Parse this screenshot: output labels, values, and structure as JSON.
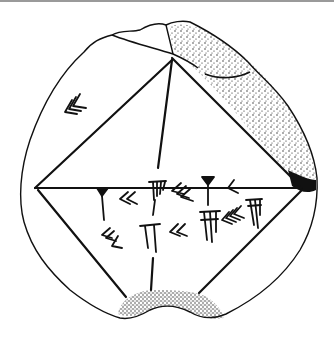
{
  "figure": {
    "colors": {
      "ink": "#111111",
      "paper": "#ffffff",
      "frame_bar": "#9a9a9a",
      "stipple": "#1a1a1a"
    },
    "rhombus": {
      "top": [
        172,
        60
      ],
      "left": [
        35,
        188
      ],
      "right": [
        302,
        188
      ],
      "bottom_left_end": [
        126,
        297
      ],
      "bottom_right_end": [
        199,
        293
      ]
    },
    "vertical_line": {
      "top": [
        172,
        60
      ],
      "bottom": [
        158,
        168
      ],
      "lower_top": [
        153,
        258
      ],
      "lower_bottom": [
        151,
        290
      ]
    },
    "cuneiform_groups": [
      {
        "name": "upper-left-tens",
        "x": 66,
        "y": 98,
        "winkel_hooks": 3
      },
      {
        "name": "row1-one",
        "x": 102,
        "y": 188,
        "wedges": 1
      },
      {
        "name": "row1-twenty",
        "x": 125,
        "y": 196,
        "winkel_hooks": 2
      },
      {
        "name": "row1-four",
        "x": 155,
        "y": 183,
        "wedges": 4
      },
      {
        "name": "row1-thirty",
        "x": 175,
        "y": 190,
        "winkel_hooks": 3
      },
      {
        "name": "row1-one-b",
        "x": 207,
        "y": 181,
        "wedges": 1
      },
      {
        "name": "row1-ten",
        "x": 231,
        "y": 188,
        "winkel_hooks": 1
      },
      {
        "name": "row2-thirty",
        "x": 100,
        "y": 232,
        "winkel_hooks": 3
      },
      {
        "name": "row2-two",
        "x": 145,
        "y": 228,
        "wedges": 2
      },
      {
        "name": "row2-twenty",
        "x": 176,
        "y": 228,
        "winkel_hooks": 2
      },
      {
        "name": "row2-six",
        "x": 206,
        "y": 215,
        "wedges": 6
      },
      {
        "name": "row2-forty",
        "x": 230,
        "y": 212,
        "winkel_hooks": 4
      },
      {
        "name": "row2-six-b",
        "x": 255,
        "y": 202,
        "wedges": 6
      }
    ]
  }
}
